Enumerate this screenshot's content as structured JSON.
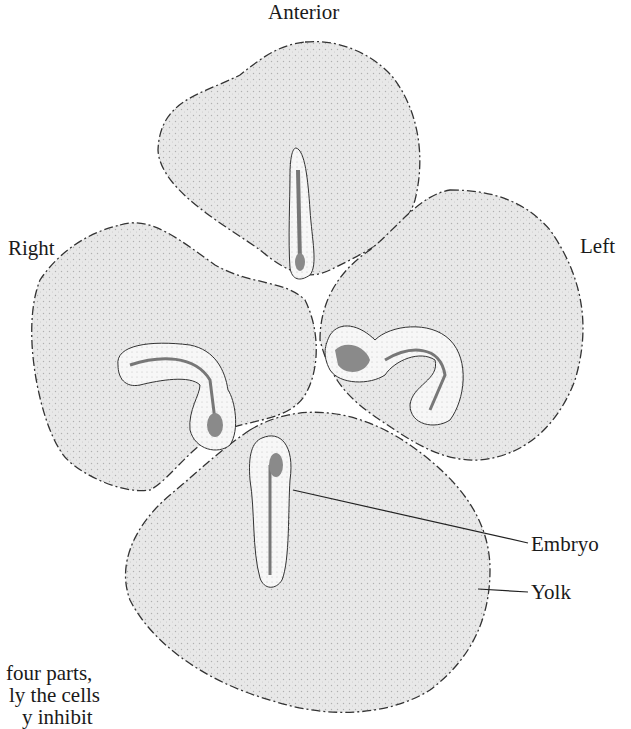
{
  "diagram": {
    "labels": {
      "anterior": "Anterior",
      "right": "Right",
      "left": "Left",
      "embryo": "Embryo",
      "yolk": "Yolk"
    },
    "caption_fragment": [
      "four parts,",
      "ly the cells",
      "y inhibit"
    ],
    "colors": {
      "yolk_fill": "#e6e6e6",
      "yolk_outline": "#333333",
      "embryo_fill": "#f4f4f4",
      "embryo_core": "#8a8a8a",
      "somite": "#a0a0a0"
    },
    "parts": [
      {
        "name": "anterior-quarter",
        "embryo_shape": "straight"
      },
      {
        "name": "right-quarter",
        "embryo_shape": "curled"
      },
      {
        "name": "left-quarter",
        "embryo_shape": "curled"
      },
      {
        "name": "posterior-quarter",
        "embryo_shape": "straight"
      }
    ]
  }
}
